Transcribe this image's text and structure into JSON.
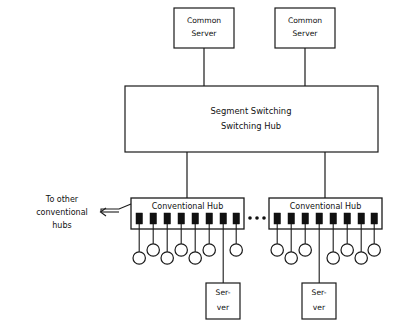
{
  "diagram": {
    "colors": {
      "stroke": "#1a1a1a",
      "background": "#ffffff",
      "port_fill": "#111111"
    },
    "common_servers": [
      {
        "id": "common-server-left",
        "line1": "Common",
        "line2": "Server"
      },
      {
        "id": "common-server-right",
        "line1": "Common",
        "line2": "Server"
      }
    ],
    "central": {
      "line1": "Segment Switching",
      "line2": "Switching Hub"
    },
    "hubs": [
      {
        "id": "conventional-hub-left",
        "label": "Conventional Hub",
        "port_count": 8,
        "terminal_count": 7,
        "server": {
          "line1": "Ser-",
          "line2": "ver"
        }
      },
      {
        "id": "conventional-hub-right",
        "label": "Conventional Hub",
        "port_count": 8,
        "terminal_count": 7,
        "server": {
          "line1": "Ser-",
          "line2": "ver"
        }
      }
    ],
    "ellipsis": {
      "glyph": "•••",
      "dot_count": 3
    },
    "annotation": {
      "line1": "To other",
      "line2": "conventional",
      "line3": "hubs",
      "arrow_direction": "left"
    }
  }
}
